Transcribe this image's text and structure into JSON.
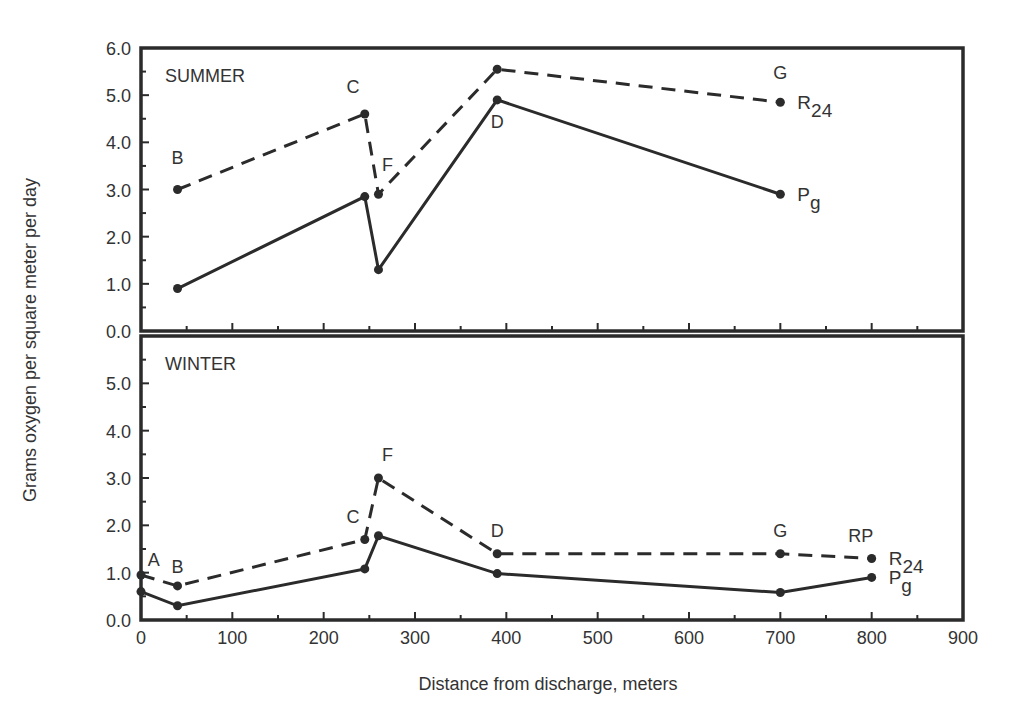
{
  "chart_data": {
    "type": "line",
    "xlabel": "Distance from discharge, meters",
    "ylabel": "Grams oxygen per square meter per day",
    "xlim": [
      0,
      900
    ],
    "xticks": [
      0,
      100,
      200,
      300,
      400,
      500,
      600,
      700,
      800,
      900
    ],
    "xtick_labels": [
      "0",
      "100",
      "200",
      "300",
      "400",
      "500",
      "600",
      "700",
      "800",
      "900"
    ],
    "panels": [
      {
        "title": "SUMMER",
        "ylim": [
          0,
          6
        ],
        "yticks": [
          0,
          1,
          2,
          3,
          4,
          5,
          6
        ],
        "ytick_labels": [
          "0.0",
          "1.0",
          "2.0",
          "3.0",
          "4.0",
          "5.0",
          "6.0"
        ],
        "series": [
          {
            "name": "R24",
            "label_main": "R",
            "label_sub": "24",
            "style": "dashed",
            "x": [
              40,
              245,
              260,
              390,
              700
            ],
            "values": [
              3.0,
              4.6,
              2.9,
              5.55,
              4.85
            ]
          },
          {
            "name": "Pg",
            "label_main": "P",
            "label_sub": "g",
            "style": "solid",
            "x": [
              40,
              245,
              260,
              390,
              700
            ],
            "values": [
              0.9,
              2.85,
              1.3,
              4.9,
              2.9
            ]
          }
        ],
        "station_labels": [
          {
            "text": "B",
            "x": 40,
            "y": 3.55
          },
          {
            "text": "C",
            "x": 232,
            "y": 5.05
          },
          {
            "text": "F",
            "x": 270,
            "y": 3.4
          },
          {
            "text": "D",
            "x": 390,
            "y": 4.3
          },
          {
            "text": "G",
            "x": 700,
            "y": 5.35
          }
        ]
      },
      {
        "title": "WINTER",
        "ylim": [
          0,
          6
        ],
        "yticks": [
          0,
          1,
          2,
          3,
          4,
          5
        ],
        "ytick_labels": [
          "0.0",
          "1.0",
          "2.0",
          "3.0",
          "4.0",
          "5.0"
        ],
        "series": [
          {
            "name": "R24",
            "label_main": "R",
            "label_sub": "24",
            "style": "dashed",
            "x": [
              0,
              40,
              245,
              260,
              390,
              700,
              800
            ],
            "values": [
              0.95,
              0.72,
              1.7,
              3.0,
              1.4,
              1.4,
              1.3
            ]
          },
          {
            "name": "Pg",
            "label_main": "P",
            "label_sub": "g",
            "style": "solid",
            "x": [
              0,
              40,
              245,
              260,
              390,
              700,
              800
            ],
            "values": [
              0.6,
              0.3,
              1.08,
              1.78,
              0.98,
              0.58,
              0.9
            ]
          }
        ],
        "station_labels": [
          {
            "text": "A",
            "x": 14,
            "y": 1.15
          },
          {
            "text": "B",
            "x": 40,
            "y": 1.0
          },
          {
            "text": "C",
            "x": 232,
            "y": 2.05
          },
          {
            "text": "F",
            "x": 270,
            "y": 3.35
          },
          {
            "text": "D",
            "x": 390,
            "y": 1.75
          },
          {
            "text": "G",
            "x": 700,
            "y": 1.75
          },
          {
            "text": "RP",
            "x": 788,
            "y": 1.65
          }
        ]
      }
    ],
    "grid": false,
    "legend": "inline labels at line ends (R24 dashed, Pg solid)"
  },
  "colors": {
    "ink": "#2b2b2b",
    "background": "#ffffff"
  }
}
